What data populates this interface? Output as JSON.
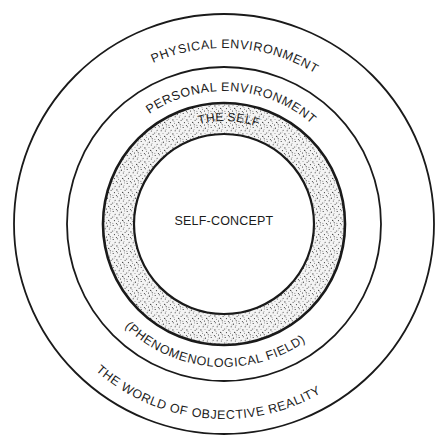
{
  "diagram": {
    "type": "concentric-circles",
    "center": [
      224,
      224
    ],
    "colors": {
      "line": "#1a1a1a",
      "text": "#1c1c1c",
      "stipple": "#2a2a2a",
      "background": "#ffffff"
    },
    "rings": [
      {
        "name": "world-of-objective-reality",
        "radius": 210
      },
      {
        "name": "phenomenological-field",
        "radius": 157
      },
      {
        "name": "the-self-outer",
        "radius": 121,
        "shaded": true
      },
      {
        "name": "self-concept",
        "radius": 90
      }
    ],
    "labels": {
      "physical_environment": "PHYSICAL ENVIRONMENT",
      "personal_environment": "PERSONAL ENVIRONMENT",
      "the_self": "THE SELF",
      "self_concept": "SELF-CONCEPT",
      "phenomenological_field": "(PHENOMENOLOGICAL FIELD)",
      "world_of_objective_reality": "THE WORLD OF OBJECTIVE REALITY"
    }
  }
}
